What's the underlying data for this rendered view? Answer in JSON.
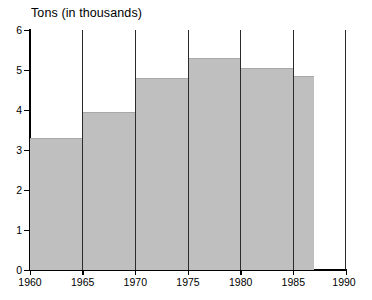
{
  "chart_data": {
    "type": "bar",
    "title": "Tons (in thousands)",
    "xlabel": "",
    "ylabel": "",
    "categories": [
      "1960",
      "1965",
      "1970",
      "1975",
      "1980",
      "1985"
    ],
    "values": [
      3.3,
      3.95,
      4.8,
      5.3,
      5.05,
      4.85
    ],
    "bins": [
      {
        "start": 1960,
        "end": 1965,
        "value": 3.3
      },
      {
        "start": 1965,
        "end": 1970,
        "value": 3.95
      },
      {
        "start": 1970,
        "end": 1975,
        "value": 4.8
      },
      {
        "start": 1975,
        "end": 1980,
        "value": 5.3
      },
      {
        "start": 1980,
        "end": 1985,
        "value": 5.05
      },
      {
        "start": 1985,
        "end": 1987,
        "value": 4.85
      }
    ],
    "xlim": [
      1960,
      1990
    ],
    "ylim": [
      0,
      6
    ],
    "x_ticks": [
      "1960",
      "1965",
      "1970",
      "1975",
      "1980",
      "1985",
      "1990"
    ],
    "y_ticks": [
      "0",
      "1",
      "2",
      "3",
      "4",
      "5",
      "6"
    ],
    "grid": "vertical",
    "legend": null,
    "bar_color": "#bfbfbf",
    "axis_color": "#000000",
    "background": "#ffffff"
  },
  "axes": {
    "y_labels": [
      "6",
      "5",
      "4",
      "3",
      "2",
      "1",
      "0"
    ],
    "x_labels": [
      "1960",
      "1965",
      "1970",
      "1975",
      "1980",
      "1985",
      "1990"
    ]
  }
}
